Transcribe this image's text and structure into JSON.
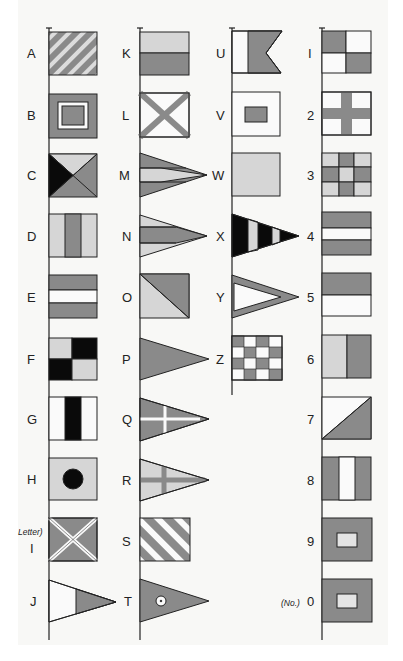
{
  "colors": {
    "dark": "#8a8a8a",
    "light": "#d6d6d6",
    "white": "#fafafa",
    "black": "#0a0a0a",
    "outline": "#222222",
    "background": "#f8f8f6"
  },
  "columns": [
    {
      "pole_x": 49,
      "flags": [
        {
          "label": "A",
          "design": "diagonal-stripes"
        },
        {
          "label": "B",
          "design": "nested-squares"
        },
        {
          "label": "C",
          "design": "quartered-triangles-black"
        },
        {
          "label": "D",
          "design": "three-vertical-stripes"
        },
        {
          "label": "E",
          "design": "three-horizontal-stripes"
        },
        {
          "label": "F",
          "design": "checker-black"
        },
        {
          "label": "G",
          "design": "black-center-stripe"
        },
        {
          "label": "H",
          "design": "black-disc"
        },
        {
          "label": "I",
          "prefix": "Letter)",
          "design": "saltire-dark"
        },
        {
          "label": "J",
          "design": "pennant-split"
        }
      ]
    },
    {
      "pole_x": 140,
      "flags": [
        {
          "label": "K",
          "design": "two-horizontal"
        },
        {
          "label": "L",
          "design": "saltire-light"
        },
        {
          "label": "M",
          "design": "pennant-three-stripes",
          "side_label": "W"
        },
        {
          "label": "N",
          "design": "pennant-three-stripes-inverse",
          "side_label": "X"
        },
        {
          "label": "O",
          "design": "diagonal-split"
        },
        {
          "label": "P",
          "design": "pennant-solid",
          "side_label": "Z"
        },
        {
          "label": "Q",
          "design": "pennant-white-cross"
        },
        {
          "label": "R",
          "design": "pennant-dark-cross"
        },
        {
          "label": "S",
          "design": "diagonal-stripes-wide"
        },
        {
          "label": "T",
          "design": "pennant-dot"
        }
      ]
    },
    {
      "pole_x": 232,
      "flags": [
        {
          "label": "U",
          "design": "swallowtail"
        },
        {
          "label": "V",
          "design": "small-square"
        },
        {
          "label": "W",
          "design": "plain-light"
        },
        {
          "label": "X",
          "design": "pennant-black-stripes"
        },
        {
          "label": "Y",
          "design": "pennant-outline"
        },
        {
          "label": "Z",
          "design": "checkerboard-4x4"
        }
      ]
    },
    {
      "pole_x": 322,
      "flags": [
        {
          "label": "1",
          "design": "quartered"
        },
        {
          "label": "2",
          "design": "cross"
        },
        {
          "label": "3",
          "design": "grid-3x3"
        },
        {
          "label": "4",
          "design": "three-horizontal-stripes"
        },
        {
          "label": "5",
          "design": "two-horizontal-top-dark"
        },
        {
          "label": "6",
          "design": "two-vertical"
        },
        {
          "label": "7",
          "design": "diagonal-lower-dark"
        },
        {
          "label": "8",
          "design": "three-vertical-white-center"
        },
        {
          "label": "9",
          "design": "small-window"
        },
        {
          "label": "0",
          "prefix": "(No.)",
          "design": "small-window"
        }
      ]
    }
  ],
  "side_labels": {
    "c2": [
      "U",
      "V",
      "W",
      "X",
      "Y",
      "Z"
    ],
    "c4": [
      "1",
      "2",
      "3",
      "4",
      "5",
      "6",
      "7",
      "8",
      "9",
      "0"
    ]
  },
  "labels": {
    "A": "A",
    "B": "B",
    "C": "C",
    "D": "D",
    "E": "E",
    "F": "F",
    "G": "G",
    "H": "H",
    "I": "I",
    "J": "J",
    "K": "K",
    "L": "L",
    "M": "M",
    "N": "N",
    "O": "O",
    "P": "P",
    "Q": "Q",
    "R": "R",
    "S": "S",
    "T": "T",
    "U": "U",
    "V": "V",
    "W": "W",
    "X": "X",
    "Y": "Y",
    "Z": "Z",
    "n1": "I",
    "n2": "2",
    "n3": "3",
    "n4": "4",
    "n5": "5",
    "n6": "6",
    "n7": "7",
    "n8": "8",
    "n9": "9",
    "n0": "0",
    "letter_prefix": "Letter)",
    "number_prefix": "(No.)"
  }
}
